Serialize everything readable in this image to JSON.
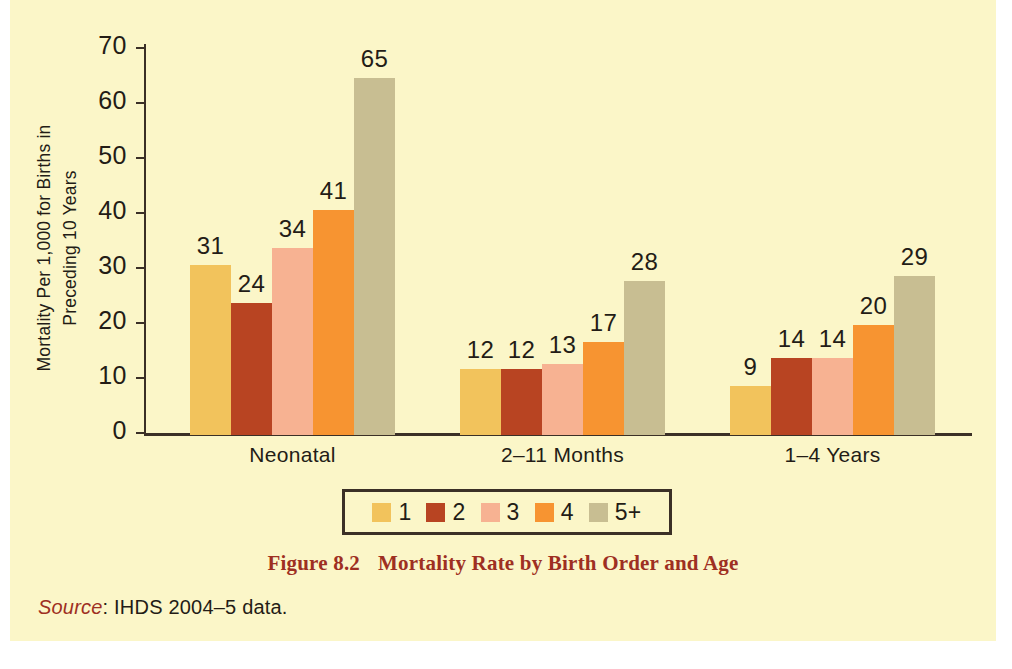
{
  "chart_data": {
    "type": "bar",
    "title": "Mortality Rate by Birth Order and Age",
    "xlabel": "",
    "ylabel": "Mortality Per 1,000 for Births in Preceding 10 Years",
    "ylim": [
      0,
      70
    ],
    "yticks": [
      0,
      10,
      20,
      30,
      40,
      50,
      60,
      70
    ],
    "grid": false,
    "legend_position": "bottom-center",
    "categories": [
      "Neonatal",
      "2–11 Months",
      "1–4 Years"
    ],
    "series": [
      {
        "name": "1",
        "color": "#f2c35c",
        "values": [
          31,
          12,
          9
        ]
      },
      {
        "name": "2",
        "color": "#b84422",
        "values": [
          24,
          12,
          14
        ]
      },
      {
        "name": "3",
        "color": "#f7b292",
        "values": [
          34,
          13,
          14
        ]
      },
      {
        "name": "4",
        "color": "#f79431",
        "values": [
          41,
          17,
          20
        ]
      },
      {
        "name": "5+",
        "color": "#c8be92",
        "values": [
          65,
          28,
          29
        ]
      }
    ]
  },
  "axis": {
    "y_title_line1": "Mortality Per 1,000 for Births in",
    "y_title_line2": "Preceding 10 Years",
    "tick_labels": [
      "70",
      "60",
      "50",
      "40",
      "30",
      "20",
      "10",
      "0"
    ]
  },
  "legend": {
    "items": [
      {
        "label": "1",
        "color": "#f2c35c"
      },
      {
        "label": "2",
        "color": "#b84422"
      },
      {
        "label": "3",
        "color": "#f7b292"
      },
      {
        "label": "4",
        "color": "#f79431"
      },
      {
        "label": "5+",
        "color": "#c8be92"
      }
    ]
  },
  "caption": {
    "number": "Figure 8.2",
    "text": "Mortality Rate by Birth Order and Age"
  },
  "source": {
    "word": "Source",
    "text": ": IHDS 2004–5 data."
  },
  "colors": {
    "page_background": "#fbf6c8",
    "axis": "#3b3026",
    "caption": "#9e2f22",
    "text": "#231c16"
  }
}
